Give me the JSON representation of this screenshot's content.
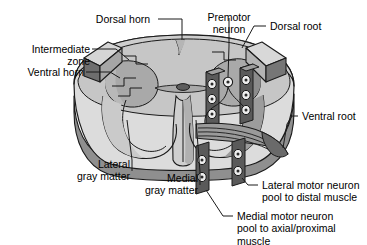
{
  "figure": {
    "background_color": "#ffffff",
    "outline_color": "#1a1a1a",
    "colors": {
      "white_matter_light": "#e3e3e3",
      "white_matter_face": "#d2d2d2",
      "gray_matter": "#a8a8a8",
      "gray_matter_dark": "#8d8d8d",
      "cut_face": "#c9c9c9",
      "cut_face_top": "#d8d8d8",
      "root_dark": "#6f6f6f",
      "column_dark": "#585858",
      "shadow": "#7a7a7a",
      "cell_fill": "#efefef"
    }
  },
  "labels": {
    "dorsal_horn": "Dorsal horn",
    "intermediate_zone": "Intermediate\nzone",
    "ventral_horn": "Ventral horn",
    "premotor_neuron": "Premotor\nneuron",
    "dorsal_root": "Dorsal root",
    "ventral_root": "Ventral root",
    "lateral_gray_matter": "Lateral\ngray matter",
    "medial_gray_matter": "Medial\ngray matter",
    "lateral_motor_pool": "Lateral motor neuron\npool to distal muscle",
    "medial_motor_pool": "Medial motor neuron\npool to axial/proximal\nmuscle"
  },
  "structures": {
    "motor_columns": [
      {
        "name": "medial-motor-column-upper",
        "cells": 3
      },
      {
        "name": "lateral-motor-column-upper",
        "cells": 3
      },
      {
        "name": "medial-motor-column-lower",
        "cells": 2
      },
      {
        "name": "lateral-motor-column-lower",
        "cells": 2
      }
    ],
    "premotor_neuron_cells": 1,
    "central_canal": true,
    "ventral_median_fissure": true,
    "dorsal_median_sulcus": true
  }
}
